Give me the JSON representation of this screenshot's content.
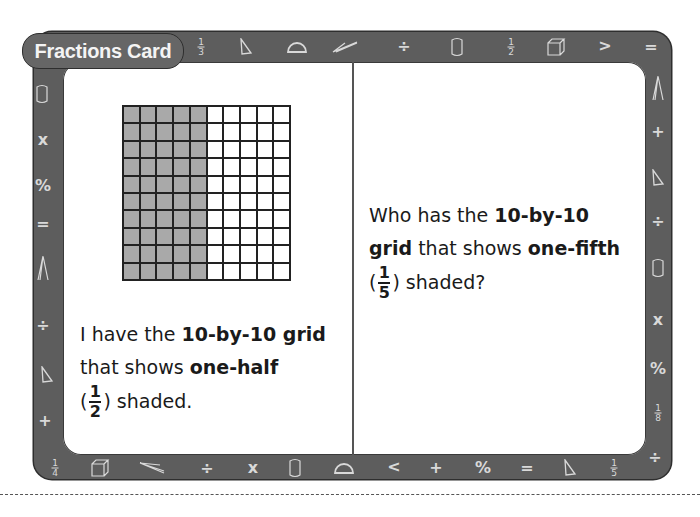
{
  "card": {
    "title": "Fractions Card",
    "frame_color": "#5d5d5d",
    "shade_color": "#a9a9a9"
  },
  "left_panel": {
    "grid": {
      "rows": 10,
      "cols": 10,
      "shaded_cols": 5
    },
    "line1_a": "I have the ",
    "line1_b": "10-by-10 grid",
    "line2_a": "that shows ",
    "line2_b": "one-half",
    "paren_open": "(",
    "frac_num": "1",
    "frac_den": "2",
    "line3_rest": ") shaded."
  },
  "right_panel": {
    "line1_a": "Who has the ",
    "line1_b": "10-by-10",
    "line2_a": "grid",
    "line2_b": " that shows ",
    "line2_c": "one-fifth",
    "paren_open": "(",
    "frac_num": "1",
    "frac_den": "5",
    "line3_rest": ") shaded?"
  },
  "border_icons": {
    "top": [
      "fraction-1/3",
      "triangle",
      "protractor",
      "compass",
      "divide",
      "cylinder",
      "fraction-1/2",
      "cube",
      "greater-than",
      "equals"
    ],
    "right": [
      "compass",
      "plus",
      "triangle",
      "divide",
      "cylinder",
      "times",
      "percent",
      "fraction-1/8",
      "divide"
    ],
    "bottom": [
      "fraction-1/4",
      "cube",
      "compass",
      "divide",
      "times",
      "cylinder",
      "protractor",
      "less-than",
      "plus",
      "percent",
      "equals",
      "triangle",
      "fraction-1/5"
    ],
    "left": [
      "cylinder",
      "times",
      "percent",
      "equals",
      "compass",
      "divide",
      "triangle",
      "plus"
    ]
  },
  "fractions": {
    "third": {
      "n": "1",
      "d": "3"
    },
    "half": {
      "n": "1",
      "d": "2"
    },
    "eighth": {
      "n": "1",
      "d": "8"
    },
    "quarter": {
      "n": "1",
      "d": "4"
    },
    "fifth": {
      "n": "1",
      "d": "5"
    }
  },
  "symbols": {
    "divide": "÷",
    "times": "x",
    "percent": "%",
    "equals": "=",
    "plus": "+",
    "greater": ">",
    "less": "<"
  }
}
